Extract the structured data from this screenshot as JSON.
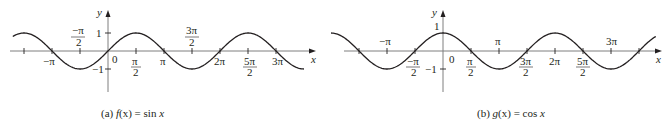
{
  "chart_data": [
    {
      "type": "line",
      "id": "a",
      "function": "sin",
      "caption": "(a) f(x) = sin x",
      "caption_parts": {
        "prefix": "(a) ",
        "fname": "f",
        "arg": "(x)",
        "eq": " = ",
        "rhs": "sin ",
        "var": "x"
      },
      "xlabel": "x",
      "ylabel": "y",
      "origin_label": "0",
      "grid": false,
      "xlim": [
        -3.85,
        3.65
      ],
      "ylim": [
        -1.6,
        1.6
      ],
      "x_range_units_pi": [
        -1.7,
        3.5
      ],
      "x_ticks": [
        {
          "value_pi": -1.5,
          "label_num": "",
          "label_den": ""
        },
        {
          "value_pi": -1,
          "label": "−π",
          "position": "below"
        },
        {
          "value_pi": -0.5,
          "label_num": "−π",
          "label_den": "2",
          "position": "above"
        },
        {
          "value_pi": 0.5,
          "label_num": "π",
          "label_den": "2",
          "position": "below"
        },
        {
          "value_pi": 1,
          "label": "π",
          "position": "below"
        },
        {
          "value_pi": 1.5,
          "label_num": "3π",
          "label_den": "2",
          "position": "above"
        },
        {
          "value_pi": 2,
          "label": "2π",
          "position": "below"
        },
        {
          "value_pi": 2.5,
          "label_num": "5π",
          "label_den": "2",
          "position": "below"
        },
        {
          "value_pi": 3,
          "label": "3π",
          "position": "below"
        }
      ],
      "y_ticks": [
        {
          "value": 1,
          "label": "1"
        },
        {
          "value": -1,
          "label": "−1"
        }
      ],
      "series": [
        {
          "name": "sin x",
          "x_pi": [
            -1.7,
            -1.5,
            -1,
            -0.5,
            0,
            0.5,
            1,
            1.5,
            2,
            2.5,
            3,
            3.5
          ],
          "y": [
            0.81,
            1,
            0,
            -1,
            0,
            1,
            0,
            -1,
            0,
            1,
            0,
            -1
          ]
        }
      ]
    },
    {
      "type": "line",
      "id": "b",
      "function": "cos",
      "caption": "(b) g(x) = cos x",
      "caption_parts": {
        "prefix": "(b) ",
        "fname": "g",
        "arg": "(x)",
        "eq": " = ",
        "rhs": "cos ",
        "var": "x"
      },
      "xlabel": "x",
      "ylabel": "y",
      "origin_label": "0",
      "grid": false,
      "x_range_units_pi": [
        -2.0,
        3.8
      ],
      "ylim": [
        -1.6,
        1.6
      ],
      "x_ticks": [
        {
          "value_pi": -1.5,
          "label_num": "",
          "label_den": ""
        },
        {
          "value_pi": -1,
          "label": "−π",
          "position": "above"
        },
        {
          "value_pi": -0.5,
          "label_num": "−π",
          "label_den": "2",
          "position": "below"
        },
        {
          "value_pi": 0.5,
          "label_num": "π",
          "label_den": "2",
          "position": "below"
        },
        {
          "value_pi": 1,
          "label": "π",
          "position": "above"
        },
        {
          "value_pi": 1.5,
          "label_num": "3π",
          "label_den": "2",
          "position": "below"
        },
        {
          "value_pi": 2,
          "label": "2π",
          "position": "below"
        },
        {
          "value_pi": 2.5,
          "label_num": "5π",
          "label_den": "2",
          "position": "below"
        },
        {
          "value_pi": 3,
          "label": "3π",
          "position": "above"
        },
        {
          "value_pi": 3.5,
          "label_num": "",
          "label_den": ""
        }
      ],
      "y_ticks": [
        {
          "value": 1,
          "label": "1"
        },
        {
          "value": -1,
          "label": "−1"
        }
      ],
      "series": [
        {
          "name": "cos x",
          "x_pi": [
            -2.0,
            -1.5,
            -1,
            -0.5,
            0,
            0.5,
            1,
            1.5,
            2,
            2.5,
            3,
            3.5,
            3.8
          ],
          "y": [
            1,
            0,
            -1,
            0,
            1,
            0,
            -1,
            0,
            1,
            0,
            -1,
            0,
            0.59
          ]
        }
      ]
    }
  ],
  "figures": {
    "a": {
      "y_label": "y",
      "x_label": "x",
      "origin": "0",
      "one": "1",
      "neg_one": "−1",
      "neg_pi": "−π",
      "neg_pi_half_num": "−π",
      "half_den": "2",
      "pi_half_num": "π",
      "pi": "π",
      "three_pi_half_num": "3π",
      "two_pi": "2π",
      "five_pi_half_num": "5π",
      "three_pi": "3π",
      "caption_prefix": "(a) ",
      "caption_fname": "f",
      "caption_arg": "(x)",
      "caption_eq": " = sin ",
      "caption_var": "x"
    },
    "b": {
      "y_label": "y",
      "x_label": "x",
      "origin": "0",
      "one": "1",
      "neg_one": "−1",
      "neg_pi": "−π",
      "neg_pi_half_num": "−π",
      "half_den": "2",
      "pi_half_num": "π",
      "pi": "π",
      "three_pi_half_num": "3π",
      "two_pi": "2π",
      "five_pi_half_num": "5π",
      "three_pi": "3π",
      "caption_prefix": "(b) ",
      "caption_fname": "g",
      "caption_arg": "(x)",
      "caption_eq": " = cos ",
      "caption_var": "x"
    }
  }
}
